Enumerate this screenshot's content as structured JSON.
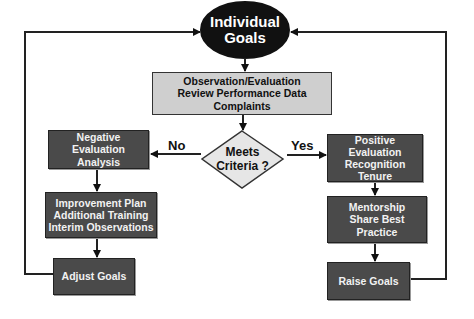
{
  "diagram": {
    "start": {
      "line1": "Individual",
      "line2": "Goals"
    },
    "observe": {
      "line1": "Observation/Evaluation",
      "line2": "Review Performance Data",
      "line3": "Complaints"
    },
    "decision": {
      "line1": "Meets",
      "line2": "Criteria ?"
    },
    "no_label": "No",
    "yes_label": "Yes",
    "negative": {
      "line1": "Negative Evaluation",
      "line2": "Analysis"
    },
    "improvement": {
      "line1": "Improvement Plan",
      "line2": "Additional Training",
      "line3": "Interim Observations"
    },
    "adjust": {
      "line1": "Adjust Goals"
    },
    "positive": {
      "line1": "Positive Evaluation",
      "line2": "Recognition",
      "line3": "Tenure"
    },
    "mentorship": {
      "line1": "Mentorship",
      "line2": "Share Best Practice"
    },
    "raise": {
      "line1": "Raise Goals"
    },
    "colors": {
      "dark_box": "#4a4a4a",
      "gray_box": "#cfcfcf",
      "ellipse": "#111111",
      "diamond": "#e6e6e6",
      "line": "#222222"
    }
  }
}
